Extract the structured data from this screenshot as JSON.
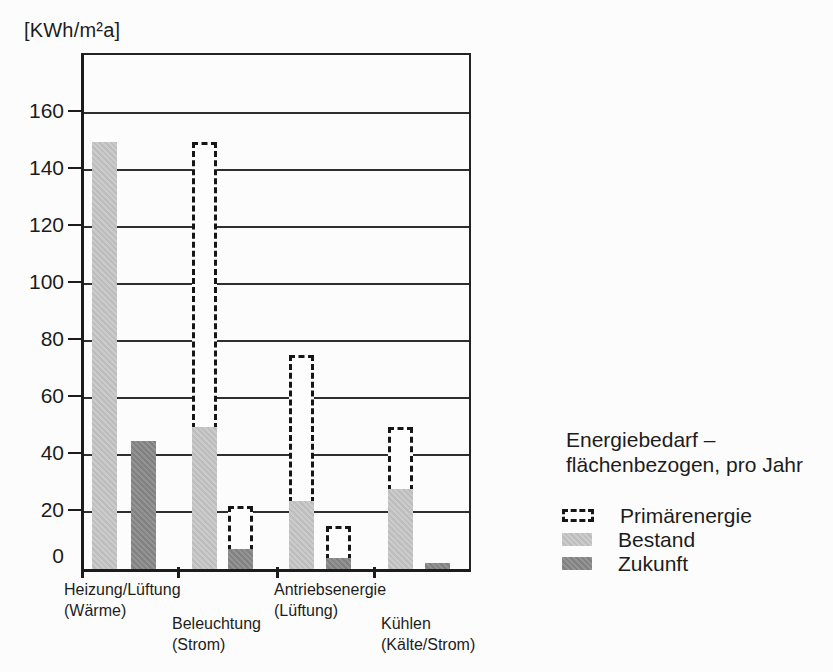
{
  "chart_data": {
    "type": "bar",
    "title": "Energiebedarf – flächenbezogen, pro Jahr",
    "ylabel": "[KWh/m²a]",
    "xlabel": "",
    "ylim": [
      0,
      180
    ],
    "yticks": [
      0,
      20,
      40,
      60,
      80,
      100,
      120,
      140,
      160
    ],
    "grid": true,
    "legend_position": "right",
    "legend_title": [
      "Energiebedarf –",
      "flächenbezogen, pro Jahr"
    ],
    "legend": [
      {
        "label": "Primärenergie",
        "style": "dashed-outline",
        "color": "#161616"
      },
      {
        "label": "Bestand",
        "style": "hatched-fill",
        "color": "#c6c6c6"
      },
      {
        "label": "Zukunft",
        "style": "hatched-fill",
        "color": "#8a8a8a"
      }
    ],
    "categories": [
      {
        "line1": "Heizung/Lüftung",
        "line2": "(Wärme)"
      },
      {
        "line1": "Beleuchtung",
        "line2": "(Strom)"
      },
      {
        "line1": "Antriebsenergie",
        "line2": "(Lüftung)"
      },
      {
        "line1": "Kühlen",
        "line2": "(Kälte/Strom)"
      }
    ],
    "groups": [
      {
        "bestand": 150,
        "bestand_primaerenergie": null,
        "zukunft": 45,
        "zukunft_primaerenergie": null
      },
      {
        "bestand": 50,
        "bestand_primaerenergie": 150,
        "zukunft": 7,
        "zukunft_primaerenergie": 22
      },
      {
        "bestand": 24,
        "bestand_primaerenergie": 75,
        "zukunft": 4,
        "zukunft_primaerenergie": 15
      },
      {
        "bestand": 28,
        "bestand_primaerenergie": 50,
        "zukunft": 2,
        "zukunft_primaerenergie": null
      }
    ],
    "colors": {
      "bestand_fill": "#c6c6c6",
      "zukunft_fill": "#8a8a8a",
      "axis_line": "#1c1c1c",
      "background": "#fcfcfc"
    }
  }
}
